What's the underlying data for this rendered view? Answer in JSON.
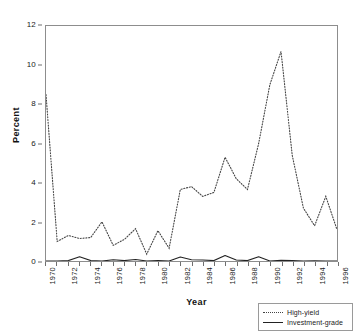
{
  "chart_data": {
    "type": "line",
    "title": "",
    "xlabel": "Year",
    "ylabel": "Percent",
    "xlim": [
      1970,
      1996
    ],
    "ylim": [
      0,
      12
    ],
    "ytick_labels": [
      "0",
      "2",
      "4",
      "6",
      "8",
      "10",
      "12"
    ],
    "ytick_values": [
      0,
      2,
      4,
      6,
      8,
      10,
      12
    ],
    "xtick_labels": [
      "1970",
      "1972",
      "1974",
      "1976",
      "1978",
      "1980",
      "1982",
      "1984",
      "1986",
      "1988",
      "1990",
      "1992",
      "1994",
      "1996"
    ],
    "xtick_values": [
      1970,
      1972,
      1974,
      1976,
      1978,
      1980,
      1982,
      1984,
      1986,
      1988,
      1990,
      1992,
      1994,
      1996
    ],
    "minor_xticks": [
      1971,
      1973,
      1975,
      1977,
      1979,
      1981,
      1983,
      1985,
      1987,
      1989,
      1991,
      1993,
      1995
    ],
    "grid": false,
    "legend_position": "bottom-right",
    "x": [
      1970,
      1971,
      1972,
      1973,
      1974,
      1975,
      1976,
      1977,
      1978,
      1979,
      1980,
      1981,
      1982,
      1983,
      1984,
      1985,
      1986,
      1987,
      1988,
      1989,
      1990,
      1991,
      1992,
      1993,
      1994,
      1995,
      1996
    ],
    "series": [
      {
        "name": "High-yield",
        "style": "dotted",
        "color": "#444444",
        "values": [
          8.5,
          1.0,
          1.3,
          1.15,
          1.2,
          2.0,
          0.8,
          1.1,
          1.65,
          0.35,
          1.55,
          0.65,
          3.65,
          3.8,
          3.3,
          3.5,
          5.3,
          4.2,
          3.65,
          6.0,
          9.0,
          10.7,
          5.4,
          2.7,
          1.8,
          3.3,
          1.6
        ]
      },
      {
        "name": "Investment-grade",
        "style": "solid",
        "color": "#222222",
        "values": [
          0.0,
          0.0,
          0.02,
          0.22,
          0.02,
          0.0,
          0.06,
          0.02,
          0.08,
          0.0,
          0.02,
          0.0,
          0.2,
          0.06,
          0.05,
          0.02,
          0.28,
          0.05,
          0.02,
          0.22,
          0.0,
          0.04,
          0.02,
          0.0,
          0.01,
          0.0,
          0.0
        ]
      }
    ]
  },
  "legend": {
    "entries": [
      {
        "label": "High-yield",
        "style": "dotted"
      },
      {
        "label": "Investment-grade",
        "style": "solid"
      }
    ]
  }
}
